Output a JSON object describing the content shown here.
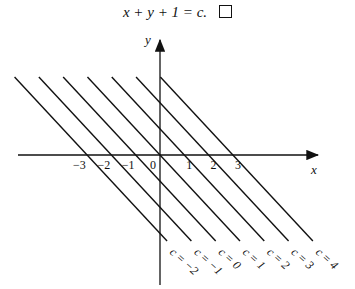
{
  "equation": {
    "text": "x + y + 1 = c.",
    "end_mark": "qed-box"
  },
  "axes": {
    "x_label": "x",
    "y_label": "y"
  },
  "x_ticks": [
    "-3",
    "-2",
    "-1",
    "0",
    "1",
    "2",
    "3"
  ],
  "lines": [
    {
      "label": "c = −2",
      "c": -2
    },
    {
      "label": "c = −1",
      "c": -1
    },
    {
      "label": "c = 0",
      "c": 0
    },
    {
      "label": "c = 1",
      "c": 1
    },
    {
      "label": "c = 2",
      "c": 2
    },
    {
      "label": "c = 3",
      "c": 3
    },
    {
      "label": "c = 4",
      "c": 4
    }
  ],
  "colors": {
    "ink": "#111111",
    "background": "#ffffff"
  }
}
